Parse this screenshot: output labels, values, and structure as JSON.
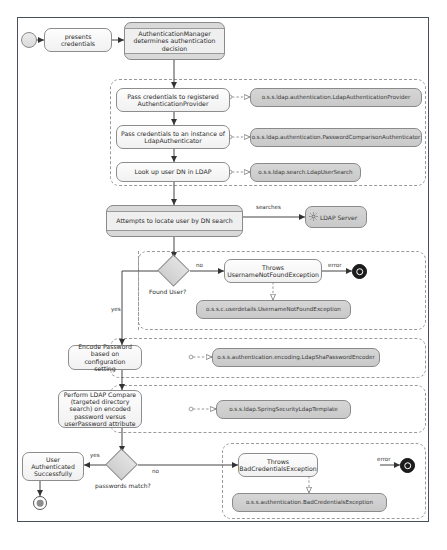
{
  "diagram": {
    "start_node": "start",
    "nodes": {
      "presents_credentials": "presents credentials",
      "auth_manager": "AuthenticationManager determines authentication decision",
      "pass_to_provider": "Pass credentials to registered AuthenticationProvider",
      "pass_to_authenticator": "Pass credentials to an instance of LdapAuthenticator",
      "lookup_dn": "Look up user DN in LDAP",
      "attempts_locate": "Attempts to locate user by DN search",
      "ldap_server": "LDAP Server",
      "found_user_decision": "Found User?",
      "throws_unfe": "Throws UsernameNotFoundException",
      "encode_password": "Encode Password based on configuration setting",
      "ldap_compare": "Perform LDAP Compare (targeted directory search) on encoded password versus userPassword attribute",
      "passwords_match_decision": "passwords match?",
      "user_authenticated": "User Authenticated Successfully",
      "throws_bce": "Throws BadCredentialsException"
    },
    "class_notes": {
      "ldap_auth_provider": "o.s.s.ldap.authentication.LdapAuthenticationProvider",
      "password_comparison": "o.s.s.ldap.authentication.PasswordComparisonAuthenticator",
      "ldap_user_search": "o.s.s.ldap.search.LdapUserSearch",
      "username_not_found_exception": "o.s.s.c.userdetails.UsernameNotFoundException",
      "ldap_sha_encoder": "o.s.s.authentication.encoding.LdapShaPasswordEncoder",
      "spring_security_ldap_template": "o.s.s.ldap.SpringSecurityLdapTemplate",
      "bad_credentials_exception": "o.s.s.authentication.BadCredentialsException"
    },
    "edge_labels": {
      "searches": "searches",
      "found_no": "no",
      "found_yes": "yes",
      "error_unfe": "error",
      "match_yes": "yes",
      "match_no": "no",
      "error_bce": "error"
    },
    "colors": {
      "frame_border": "#4a4f5c",
      "node_fill": "#f7f7f7",
      "class_fill": "#cfcfcf",
      "band_fill": "#d9d9d9",
      "line": "#555555",
      "dashed": "#9a9a9a"
    }
  }
}
